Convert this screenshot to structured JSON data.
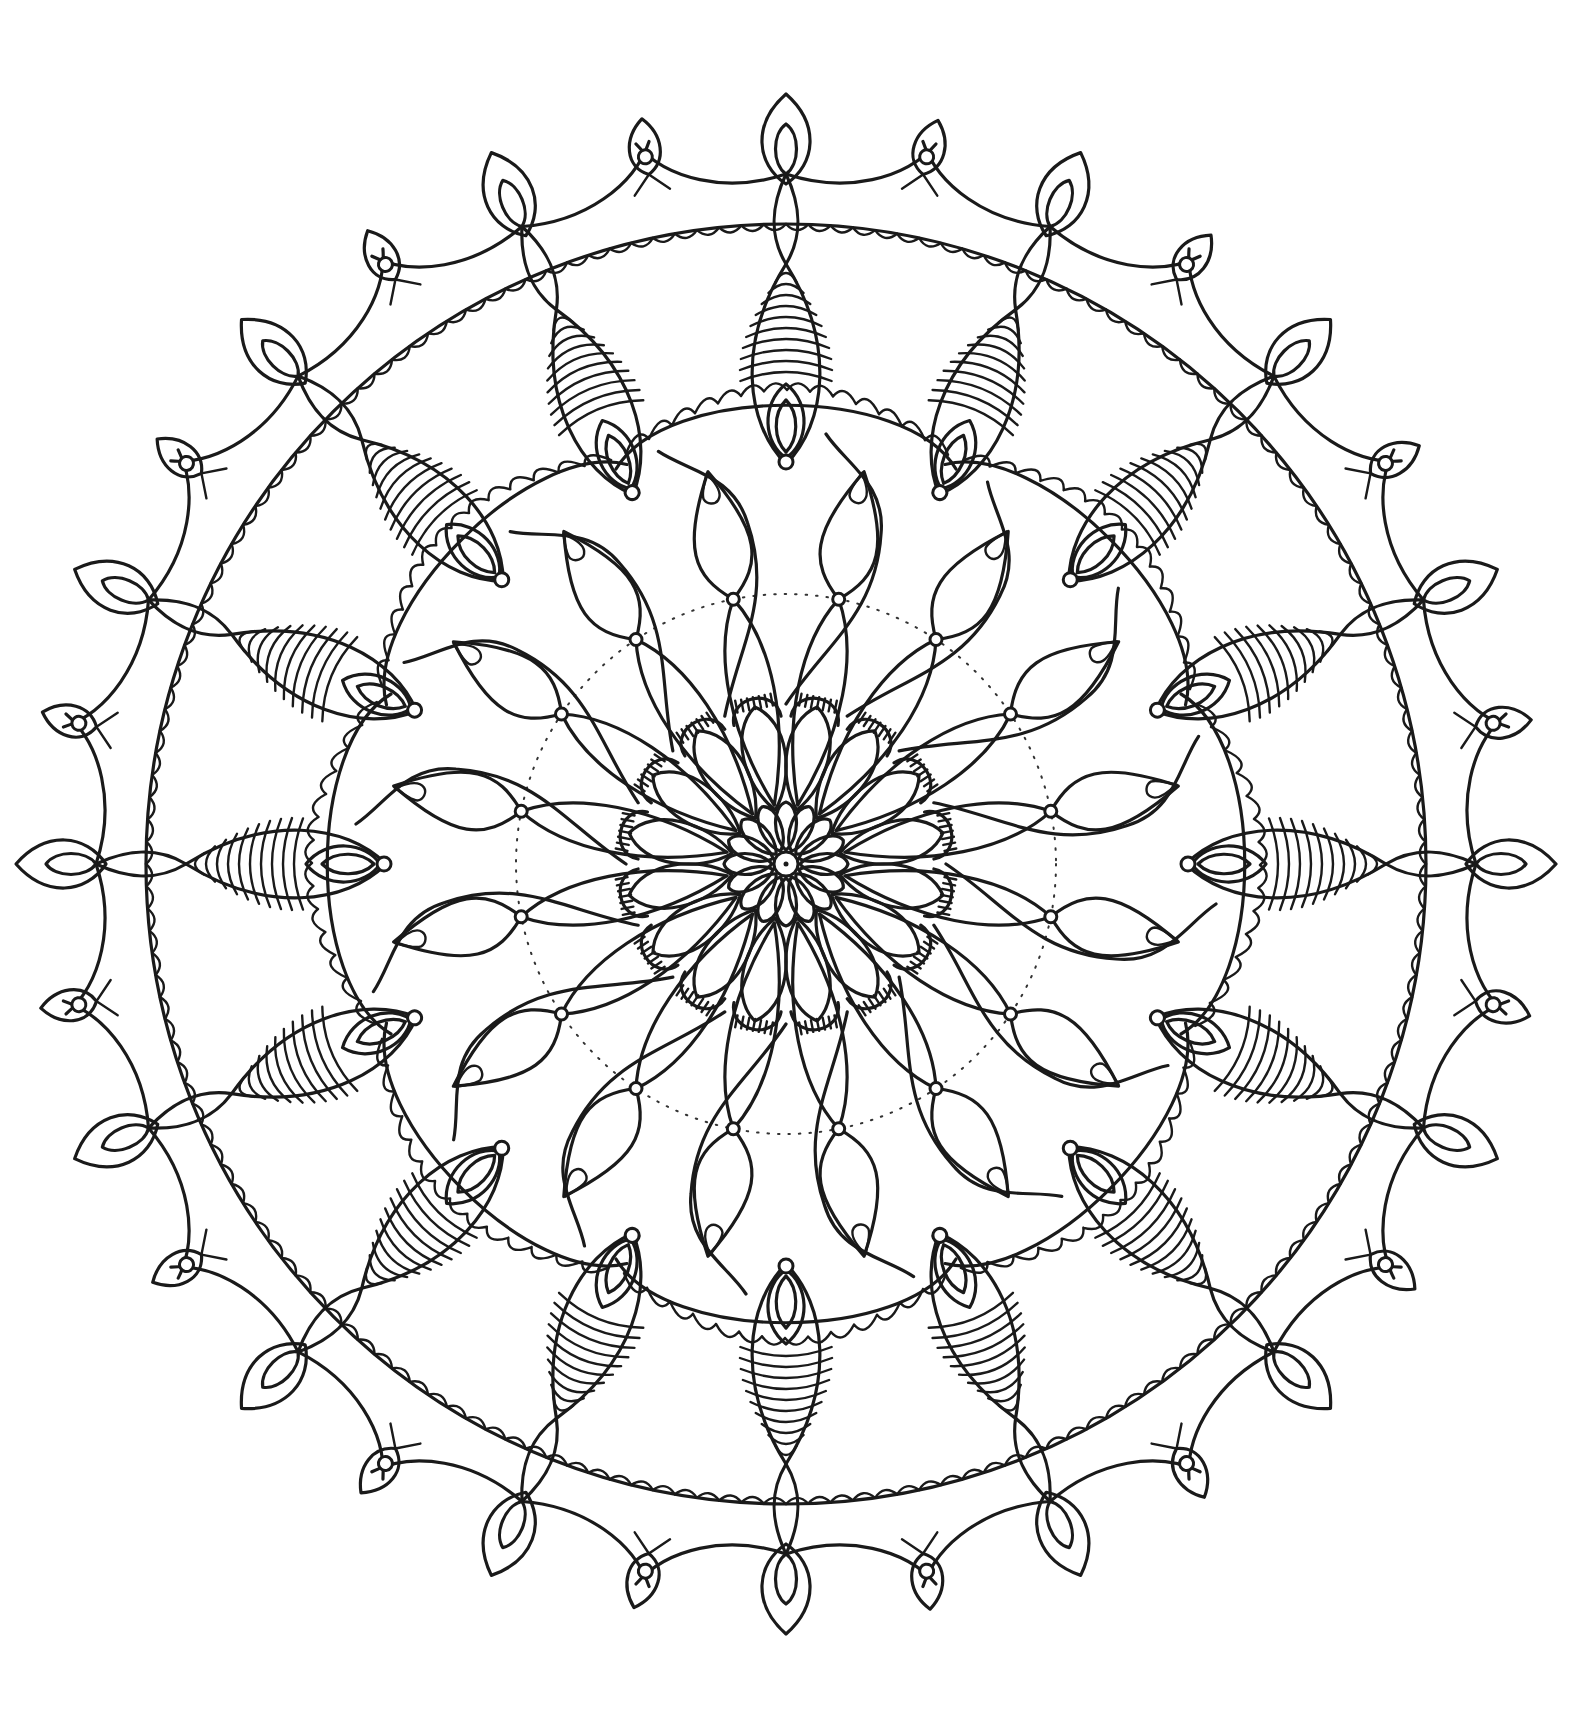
{
  "artwork": {
    "type": "mandala-coloring-page",
    "background": "#ffffff",
    "ink_color": "#1a1a1a",
    "center": [
      786,
      864
    ],
    "symmetry": 16,
    "layers": [
      {
        "name": "center-dot",
        "radius": 12
      },
      {
        "name": "inner-small-petals",
        "count": 16,
        "r_inner": 14,
        "r_outer": 62
      },
      {
        "name": "mid-petals",
        "count": 16,
        "r_inner": 55,
        "r_outer": 160
      },
      {
        "name": "hatched-petal-caps",
        "count": 16,
        "radius": 168
      },
      {
        "name": "long-leaf-spokes",
        "count": 16,
        "r_inner": 60,
        "r_outer": 355
      },
      {
        "name": "dotted-ring",
        "radius": 270
      },
      {
        "name": "ring-beads",
        "count": 16,
        "radius": 270
      },
      {
        "name": "scalloped-lobes",
        "count": 8,
        "radius": 440
      },
      {
        "name": "water-drops",
        "count": 16,
        "radius": 380
      },
      {
        "name": "striped-arms",
        "count": 16,
        "r_inner": 400,
        "r_outer": 600,
        "stripes": 10
      },
      {
        "name": "outer-scalloped-band",
        "radius": 640
      },
      {
        "name": "outer-rim",
        "radius": 680
      },
      {
        "name": "flame-finials",
        "count": 16,
        "radius": 720
      },
      {
        "name": "small-eye-finials",
        "count": 16,
        "radius": 715
      }
    ]
  }
}
